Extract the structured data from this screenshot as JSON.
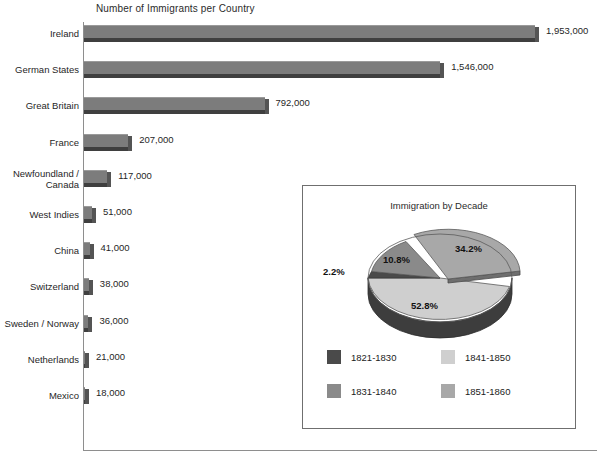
{
  "chart_data": [
    {
      "type": "bar",
      "orientation": "horizontal",
      "title": "Number of Immigrants per Country",
      "xlabel": "",
      "ylabel": "",
      "grid": false,
      "xlim": [
        0,
        1953000
      ],
      "categories": [
        "Ireland",
        "German States",
        "Great Britain",
        "France",
        "Newfoundland /\nCanada",
        "West Indies",
        "China",
        "Switzerland",
        "Sweden / Norway",
        "Netherlands",
        "Mexico"
      ],
      "values": [
        1953000,
        1546000,
        792000,
        207000,
        117000,
        51000,
        41000,
        38000,
        36000,
        21000,
        18000
      ],
      "value_labels": [
        "1,953,000",
        "1,546,000",
        "792,000",
        "207,000",
        "117,000",
        "51,000",
        "41,000",
        "38,000",
        "36,000",
        "21,000",
        "18,000"
      ],
      "bar_color": "#7c7c7c"
    },
    {
      "type": "pie",
      "title": "Immigration by Decade",
      "three_d": true,
      "exploded_slice": "1851-1860",
      "legend_position": "bottom",
      "categories": [
        "1821-1830",
        "1831-1840",
        "1841-1850",
        "1851-1860"
      ],
      "values": [
        2.2,
        10.8,
        52.8,
        34.2
      ],
      "value_labels": [
        "2.2%",
        "10.8%",
        "52.8%",
        "34.2%"
      ],
      "colors": [
        "#4a4a4a",
        "#8a8a8a",
        "#cfcfcf",
        "#a8a8a8"
      ]
    }
  ],
  "bar_chart": {
    "title": "Number of Immigrants per Country",
    "rows": [
      {
        "label": "Ireland",
        "value_label": "1,953,000"
      },
      {
        "label": "German States",
        "value_label": "1,546,000"
      },
      {
        "label": "Great Britain",
        "value_label": "792,000"
      },
      {
        "label": "France",
        "value_label": "207,000"
      },
      {
        "label": "Newfoundland /\nCanada",
        "value_label": "117,000"
      },
      {
        "label": "West Indies",
        "value_label": "51,000"
      },
      {
        "label": "China",
        "value_label": "41,000"
      },
      {
        "label": "Switzerland",
        "value_label": "38,000"
      },
      {
        "label": "Sweden / Norway",
        "value_label": "36,000"
      },
      {
        "label": "Netherlands",
        "value_label": "21,000"
      },
      {
        "label": "Mexico",
        "value_label": "18,000"
      }
    ]
  },
  "pie_chart": {
    "title": "Immigration by Decade",
    "slice_labels": {
      "d1821": "2.2%",
      "d1831": "10.8%",
      "d1841": "52.8%",
      "d1851": "34.2%"
    },
    "legend": [
      {
        "label": "1821-1830",
        "color": "#4a4a4a"
      },
      {
        "label": "1841-1850",
        "color": "#cfcfcf"
      },
      {
        "label": "1831-1840",
        "color": "#8a8a8a"
      },
      {
        "label": "1851-1860",
        "color": "#a8a8a8"
      }
    ]
  }
}
